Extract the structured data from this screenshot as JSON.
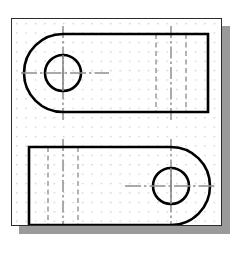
{
  "document": {
    "title": "Engineering Drawing Sheet",
    "kind": "orthographic-technical-drawing",
    "sheet_label": "",
    "background_color": "#ffffff",
    "sheet_color": "#ffffff",
    "sheet_border_color": "#2b2b2b",
    "shadow_color": "#9a9a9a"
  },
  "sheet": {
    "x": 11,
    "y": 18,
    "width": 211,
    "height": 208,
    "shadow_offset_x": 8,
    "shadow_offset_y": 8
  },
  "grid": {
    "style": "dot-grid",
    "spacing_px": 9.5,
    "dot_color": "#b9b9b9",
    "dot_radius_px": 0.7,
    "origin_x": 5,
    "origin_y": 5
  },
  "line_styles": {
    "visible_color": "#000000",
    "visible_width": 2.6,
    "hidden_color": "#9a9a9a",
    "hidden_width": 1.5,
    "hidden_dash": "5,3.5",
    "center_color": "#8f8f8f",
    "center_width": 1.5,
    "center_dash": "11,3,2.5,3"
  },
  "chart_data": {
    "type": "diagram",
    "views": [
      {
        "name": "top-view",
        "description": "Plate with rounded (semicircular) left end, square right end, one through hole at the rounded end, two hidden feature lines near the right end",
        "outline": {
          "left_arc_center_x": 62,
          "left_arc_center_y": 72,
          "arc_radius": 39,
          "top_y": 33,
          "bottom_y": 111,
          "right_x": 207
        },
        "hole": {
          "center_x": 62,
          "center_y": 72,
          "radius": 18
        },
        "hidden_lines": [
          {
            "x": 155,
            "y1": 33,
            "y2": 111
          },
          {
            "x": 185,
            "y1": 33,
            "y2": 111
          }
        ],
        "center_lines": [
          {
            "orientation": "vertical",
            "x": 62,
            "y1": 25,
            "y2": 119
          },
          {
            "orientation": "vertical",
            "x": 170,
            "y1": 25,
            "y2": 119
          },
          {
            "orientation": "horizontal",
            "y": 72,
            "x1": 20,
            "x2": 108
          }
        ]
      },
      {
        "name": "bottom-view",
        "description": "Mirror image: plate with square left end, rounded (semicircular) right end, one through hole at the rounded end, two hidden feature lines near the left end",
        "outline": {
          "right_arc_center_x": 170,
          "right_arc_center_y": 185,
          "arc_radius": 39,
          "top_y": 146,
          "bottom_y": 224,
          "left_x": 28
        },
        "hole": {
          "center_x": 170,
          "center_y": 185,
          "radius": 18
        },
        "hidden_lines": [
          {
            "x": 47,
            "y1": 146,
            "y2": 224
          },
          {
            "x": 77,
            "y1": 146,
            "y2": 224
          }
        ],
        "center_lines": [
          {
            "orientation": "vertical",
            "x": 170,
            "y1": 138,
            "y2": 232
          },
          {
            "orientation": "vertical",
            "x": 62,
            "y1": 138,
            "y2": 232
          },
          {
            "orientation": "horizontal",
            "y": 185,
            "x1": 124,
            "x2": 212
          }
        ]
      }
    ],
    "annotations": [],
    "legend": [],
    "xlabel": "",
    "ylabel": ""
  }
}
